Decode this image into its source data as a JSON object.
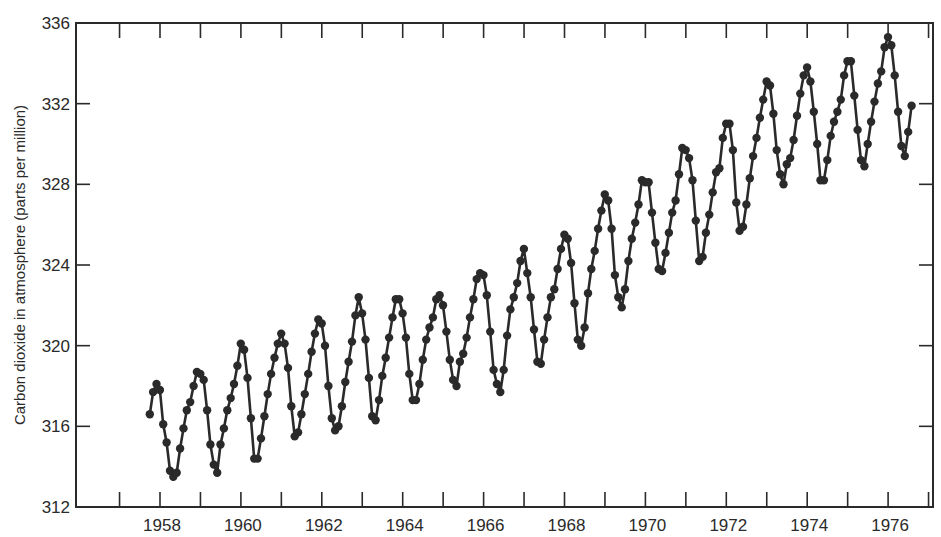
{
  "chart_data": {
    "type": "line",
    "title": "",
    "xlabel": "",
    "ylabel": "Carbon dioxide in atmosphere (parts per million)",
    "ylim": [
      312,
      336
    ],
    "xlim": [
      1956.9,
      1977.3
    ],
    "y_ticks": [
      312,
      316,
      320,
      324,
      328,
      332,
      336
    ],
    "x_ticks_labeled": [
      1958,
      1960,
      1962,
      1964,
      1966,
      1968,
      1970,
      1972,
      1974,
      1976
    ],
    "x_minor_ticks": [
      1957,
      1958,
      1959,
      1960,
      1961,
      1962,
      1963,
      1964,
      1965,
      1966,
      1967,
      1968,
      1969,
      1970,
      1971,
      1972,
      1973,
      1974,
      1975,
      1976,
      1977
    ],
    "grid": false,
    "legend": null,
    "markers": "filled-circle",
    "series": [
      {
        "name": "Monthly mean CO2 (Mauna Loa)",
        "color": "#2a2a2a",
        "start_year": 1958,
        "start_month": 3,
        "values": [
          316.6,
          317.7,
          318.1,
          317.8,
          316.1,
          315.2,
          313.8,
          313.5,
          313.7,
          314.9,
          315.9,
          316.8,
          317.2,
          318.0,
          318.7,
          318.6,
          318.3,
          316.8,
          315.1,
          314.1,
          313.7,
          315.1,
          315.9,
          316.8,
          317.4,
          318.1,
          319.0,
          320.1,
          319.8,
          318.4,
          316.4,
          314.4,
          314.4,
          315.4,
          316.5,
          317.6,
          318.6,
          319.4,
          320.1,
          320.6,
          320.1,
          318.9,
          317.0,
          315.5,
          315.7,
          316.6,
          317.6,
          318.6,
          319.7,
          320.6,
          321.3,
          321.1,
          320.0,
          318.0,
          316.4,
          315.8,
          316.0,
          317.0,
          318.2,
          319.2,
          320.2,
          321.5,
          322.4,
          321.6,
          320.3,
          318.4,
          316.5,
          316.3,
          317.3,
          318.5,
          319.4,
          320.4,
          321.4,
          322.3,
          322.3,
          321.6,
          320.4,
          318.6,
          317.3,
          317.3,
          318.1,
          319.3,
          320.3,
          320.9,
          321.4,
          322.3,
          322.5,
          322.0,
          320.7,
          319.3,
          318.3,
          318.0,
          319.2,
          319.6,
          320.4,
          321.4,
          322.3,
          323.3,
          323.6,
          323.5,
          322.5,
          320.7,
          318.8,
          318.1,
          317.7,
          318.8,
          320.5,
          321.8,
          322.4,
          323.1,
          324.2,
          324.8,
          323.6,
          322.4,
          320.8,
          319.2,
          319.1,
          320.3,
          321.4,
          322.4,
          322.8,
          323.8,
          324.8,
          325.5,
          325.3,
          324.1,
          322.1,
          320.3,
          320.0,
          320.9,
          322.6,
          323.8,
          324.7,
          325.8,
          326.7,
          327.5,
          327.2,
          325.8,
          323.5,
          322.4,
          321.9,
          322.8,
          324.2,
          325.3,
          326.1,
          327.0,
          328.2,
          328.1,
          328.1,
          326.6,
          325.1,
          323.8,
          323.7,
          324.6,
          325.6,
          326.6,
          327.2,
          328.5,
          329.8,
          329.7,
          329.3,
          328.2,
          326.2,
          324.2,
          324.4,
          325.6,
          326.5,
          327.6,
          328.6,
          328.8,
          330.3,
          331.0,
          331.0,
          329.7,
          327.1,
          325.7,
          325.9,
          327.0,
          328.3,
          329.4,
          330.3,
          331.3,
          332.2,
          333.1,
          332.9,
          331.5,
          329.7,
          328.5,
          328.0,
          329.0,
          329.3,
          330.2,
          331.4,
          332.5,
          333.4,
          333.8,
          333.1,
          331.6,
          330.0,
          328.2,
          328.2,
          329.2,
          330.4,
          331.1,
          331.6,
          332.2,
          333.4,
          334.1,
          334.1,
          332.4,
          330.7,
          329.2,
          328.9,
          330.0,
          331.1,
          332.1,
          333.0,
          333.6,
          334.8,
          335.3,
          334.9,
          333.4,
          331.6,
          329.9,
          329.4,
          330.6,
          331.9
        ]
      }
    ]
  }
}
